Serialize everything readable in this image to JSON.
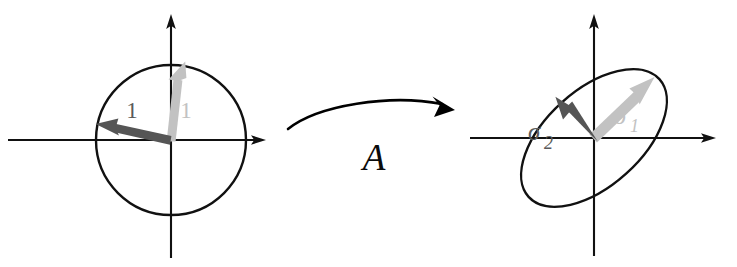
{
  "figure": {
    "width": 737,
    "height": 267,
    "background": "#ffffff"
  },
  "colors": {
    "axis": "#111111",
    "outline": "#111111",
    "vector_dark": "#555555",
    "vector_light": "#c2c2c2",
    "label_dark": "#5a5a5a",
    "label_light": "#c2c2c2",
    "map_arrow": "#000000"
  },
  "left_panel": {
    "name": "unit-circle-panel",
    "shape": "circle",
    "center": [
      171,
      140
    ],
    "radius": 75,
    "x_axis": {
      "from": [
        8,
        140
      ],
      "to": [
        266,
        140
      ]
    },
    "y_axis": {
      "from": [
        171,
        258
      ],
      "to": [
        171,
        14
      ]
    },
    "vectors": [
      {
        "name": "v1",
        "label": "1",
        "color_role": "vector_light",
        "from": [
          171,
          140
        ],
        "to": [
          185,
          62
        ],
        "label_pos": [
          186,
          118
        ]
      },
      {
        "name": "v2",
        "label": "1",
        "color_role": "vector_dark",
        "from": [
          171,
          140
        ],
        "to": [
          96,
          124
        ],
        "label_pos": [
          132,
          118
        ]
      }
    ]
  },
  "map_arrow": {
    "name": "transformation-arrow",
    "label": "A",
    "label_pos": [
      374,
      170
    ],
    "path_from": [
      288,
      129
    ],
    "path_to": [
      452,
      110
    ]
  },
  "right_panel": {
    "name": "ellipse-panel",
    "shape": "ellipse",
    "center": [
      594,
      138
    ],
    "semi_major": 88,
    "semi_minor": 48,
    "rotation_deg": -42,
    "x_axis": {
      "from": [
        470,
        138
      ],
      "to": [
        716,
        138
      ]
    },
    "y_axis": {
      "from": [
        594,
        256
      ],
      "to": [
        594,
        14
      ]
    },
    "vectors": [
      {
        "name": "sigma1",
        "label": "σ",
        "subscript": "1",
        "color_role": "vector_light",
        "from": [
          594,
          138
        ],
        "to": [
          654,
          77
        ],
        "label_pos": [
          622,
          122
        ]
      },
      {
        "name": "sigma2",
        "label": "σ",
        "subscript": "2",
        "color_role": "vector_dark",
        "from": [
          594,
          138
        ],
        "to": [
          556,
          97
        ],
        "label_pos": [
          537,
          139
        ]
      }
    ]
  }
}
